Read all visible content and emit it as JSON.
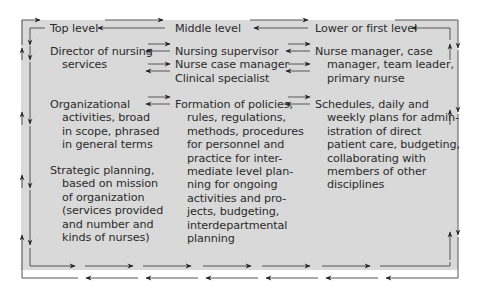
{
  "diagram": {
    "levels": [
      {
        "id": "top",
        "label": "Top level"
      },
      {
        "id": "middle",
        "label": "Middle level"
      },
      {
        "id": "lower",
        "label": "Lower or first level"
      }
    ],
    "roles": {
      "top": [
        "Director of nursing",
        "services"
      ],
      "middle": [
        "Nursing supervisor",
        "Nurse case manager",
        "Clinical specialist"
      ],
      "lower": [
        "Nurse manager, case",
        "manager, team leader,",
        "primary nurse"
      ]
    },
    "activities": {
      "top": [
        "Organizational",
        "activities, broad",
        "in scope, phrased",
        "in general terms"
      ],
      "middle": [
        "Formation of policies,",
        "rules, regulations,",
        "methods, procedures",
        "for personnel and",
        "practice for inter-",
        "mediate level plan-",
        "ning for ongoing",
        "activities and pro-",
        "jects, budgeting,",
        "interdepartmental",
        "planning"
      ],
      "lower": [
        "Schedules, daily and",
        "weekly plans for admin-",
        "istration of direct",
        "patient care, budgeting,",
        "collaborating with",
        "members of other",
        "disciplines"
      ]
    },
    "planning": {
      "top": [
        "Strategic planning,",
        "based on mission",
        "of organization",
        "(services provided",
        "and number and",
        "kinds of nurses)"
      ]
    },
    "colors": {
      "background": "#d9d9d9",
      "line": "#4a4a4a",
      "text": "#2b2b2b"
    }
  }
}
